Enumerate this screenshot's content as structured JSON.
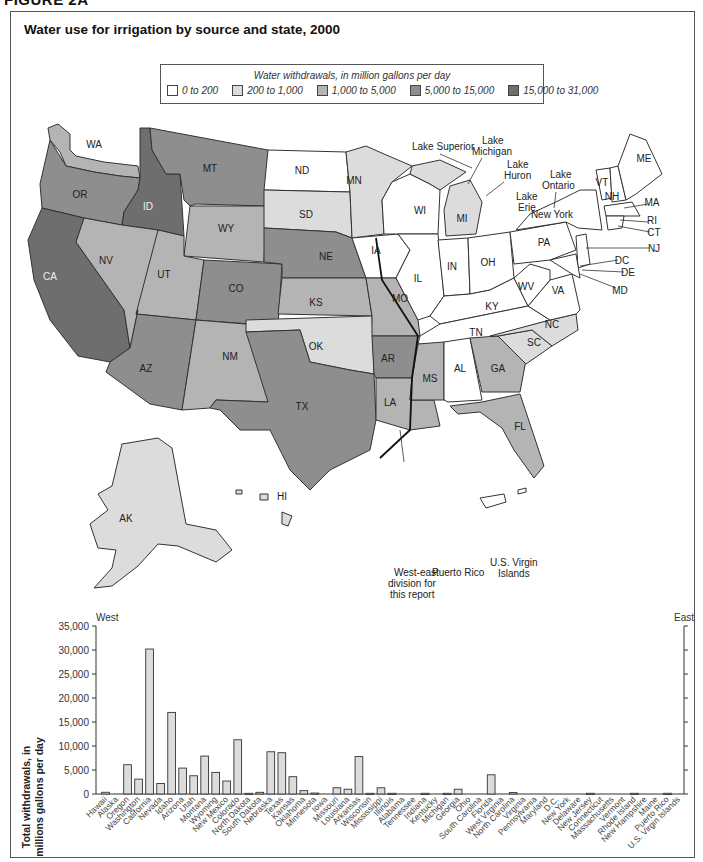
{
  "figure_label": "FIGURE 2A",
  "title": "Water use for irrigation by source and state, 2000",
  "legend": {
    "title": "Water withdrawals, in million gallons per day",
    "items": [
      {
        "label": "0 to 200",
        "color": "#ffffff"
      },
      {
        "label": "200 to 1,000",
        "color": "#dcdcdc"
      },
      {
        "label": "1,000 to 5,000",
        "color": "#b4b4b4"
      },
      {
        "label": "5,000 to 15,000",
        "color": "#8e8e8e"
      },
      {
        "label": "15,000 to 31,000",
        "color": "#6e6e6e"
      }
    ]
  },
  "map": {
    "annotations": {
      "lake_superior": "Lake Superior",
      "lake_michigan_1": "Lake",
      "lake_michigan_2": "Michigan",
      "lake_huron_1": "Lake",
      "lake_huron_2": "Huron",
      "lake_ontario_1": "Lake",
      "lake_ontario_2": "Ontario",
      "lake_erie_1": "Lake",
      "lake_erie_2": "Erie",
      "division_1": "West-east",
      "division_2": "division for",
      "division_3": "this report",
      "puerto_rico": "Puerto Rico",
      "usvi_1": "U.S. Virgin",
      "usvi_2": "Islands"
    },
    "states": {
      "WA": "WA",
      "OR": "OR",
      "CA": "CA",
      "ID": "ID",
      "NV": "NV",
      "MT": "MT",
      "WY": "WY",
      "UT": "UT",
      "AZ": "AZ",
      "CO": "CO",
      "NM": "NM",
      "ND": "ND",
      "SD": "SD",
      "NE": "NE",
      "KS": "KS",
      "OK": "OK",
      "TX": "TX",
      "MN": "MN",
      "IA": "IA",
      "MO": "MO",
      "AR": "AR",
      "LA": "LA",
      "WI": "WI",
      "IL": "IL",
      "MI": "MI",
      "IN": "IN",
      "OH": "OH",
      "KY": "KY",
      "TN": "TN",
      "MS": "MS",
      "AL": "AL",
      "GA": "GA",
      "FL": "FL",
      "SC": "SC",
      "NC": "NC",
      "VA": "VA",
      "WV": "WV",
      "PA": "PA",
      "NY": "New York",
      "VT": "VT",
      "NH": "NH",
      "ME": "ME",
      "MA": "MA",
      "RI": "RI",
      "CT": "CT",
      "NJ": "NJ",
      "DC": "DC",
      "DE": "DE",
      "MD": "MD",
      "AK": "AK",
      "HI": "HI"
    }
  },
  "chart_data": {
    "type": "bar",
    "title": "",
    "xlabel": "",
    "ylabel": "Total withdrawals, in millions gallons per day",
    "ylim": [
      0,
      35000
    ],
    "yticks": [
      "0",
      "5,000",
      "10,000",
      "15,000",
      "20,000",
      "25,000",
      "30,000",
      "35,000"
    ],
    "grid": false,
    "region_labels": {
      "west": "West",
      "east": "East"
    },
    "categories": [
      "Hawaii",
      "Alaska",
      "Oregon",
      "Washington",
      "California",
      "Nevada",
      "Idaho",
      "Arizona",
      "Utah",
      "Montana",
      "Wyoming",
      "New Mexico",
      "Colorado",
      "North Dakota",
      "South Dakota",
      "Nebraska",
      "Texas",
      "Kansas",
      "Oklahoma",
      "Minnesota",
      "Iowa",
      "Missouri",
      "Louisiana",
      "Arkansas",
      "Wisconsin",
      "Mississippi",
      "Illinois",
      "Alabama",
      "Tennessee",
      "Indiana",
      "Kentucky",
      "Michigan",
      "Georgia",
      "Ohio",
      "South Carolina",
      "Florida",
      "West Virginia",
      "North Carolina",
      "Virginia",
      "Pennsylvania",
      "Maryland",
      "D.C.",
      "New York",
      "Delaware",
      "New Jersey",
      "Connecticut",
      "Massachusetts",
      "Vermont",
      "Rhode Island",
      "New Hampshire",
      "Maine",
      "Puerto Rico",
      "U.S. Virgin Islands"
    ],
    "values": [
      360,
      0,
      6100,
      3100,
      30200,
      2200,
      17000,
      5400,
      3800,
      7900,
      4500,
      2700,
      11300,
      150,
      350,
      8800,
      8600,
      3600,
      700,
      200,
      0,
      1300,
      1000,
      7800,
      150,
      1300,
      150,
      0,
      0,
      150,
      0,
      150,
      1000,
      0,
      0,
      4000,
      0,
      300,
      0,
      0,
      0,
      0,
      0,
      0,
      150,
      0,
      0,
      0,
      150,
      0,
      0,
      150,
      0
    ]
  }
}
